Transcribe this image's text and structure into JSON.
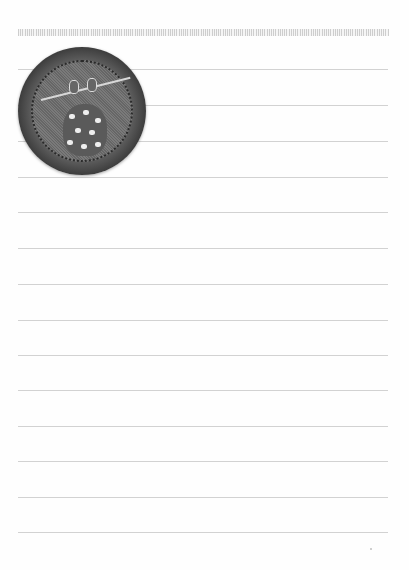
{
  "page": {
    "type": "lined notebook paper",
    "background_color": "#fefefe",
    "rule_color": "#d2d2d2",
    "rule_count": 14,
    "rule_positions_y": [
      69,
      105,
      141,
      177,
      212,
      248,
      284,
      320,
      355,
      390,
      426,
      461,
      497,
      532
    ]
  },
  "badge": {
    "description": "embroidered circular patch with polka-dot bindle bag on a stick",
    "icon": "bindle-patch-icon",
    "border_color": "#1c1c1c",
    "fill_color": "#6e6e6e"
  }
}
